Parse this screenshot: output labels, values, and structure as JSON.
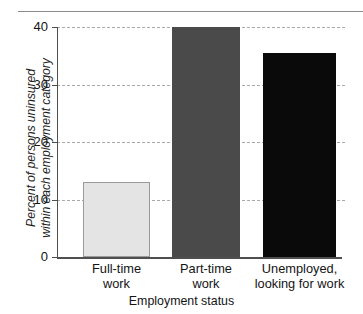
{
  "figure": {
    "background_color": "#ffffff",
    "rule_color": "#8c8c8c"
  },
  "chart_data": {
    "type": "bar",
    "title": "",
    "subtitle": "",
    "xlabel": "Employment status",
    "ylabel": "Percent of persons uninsured within each employment category",
    "ylabel_line1": "Percent of persons uninsured",
    "ylabel_line2": "within each employment category",
    "categories": [
      "Full-time work",
      "Part-time work",
      "Unemployed, looking for work"
    ],
    "category_lines": [
      [
        "Full-time",
        "work"
      ],
      [
        "Part-time",
        "work"
      ],
      [
        "Unemployed,",
        "looking for work"
      ]
    ],
    "values": [
      13,
      40,
      35.5
    ],
    "bar_colors": [
      "#e4e4e4",
      "#4a4a4a",
      "#0a0a0a"
    ],
    "bar_border_colors": [
      "#9a9a9a",
      "#4a4a4a",
      "#0a0a0a"
    ],
    "ylim": [
      0,
      40
    ],
    "yticks": [
      0,
      10,
      20,
      30,
      40
    ],
    "ytick_labels": [
      "0",
      "10",
      "20",
      "30",
      "40"
    ],
    "grid": true,
    "grid_axis": "y",
    "grid_style": "dashed",
    "grid_color": "#a9a9a9",
    "legend": "none",
    "axis_color": "#4f4f4f"
  }
}
